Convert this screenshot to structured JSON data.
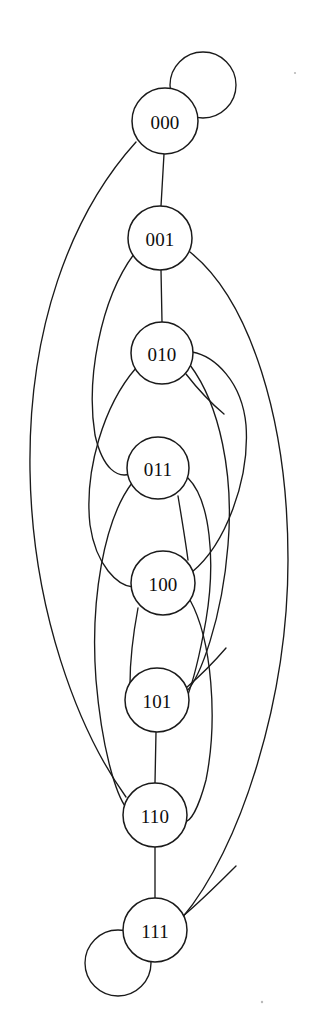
{
  "figure": {
    "background_color": "#ffffff",
    "stroke_color": "#1a1a1a",
    "label_color": "#0d0d0d",
    "width": 313,
    "height": 1035
  },
  "graph": {
    "kind": "de-bruijn-graph",
    "node_count": 8,
    "node_radius": 32,
    "nodes": [
      {
        "id": "n000",
        "label": "000",
        "cx": 165,
        "cy": 121,
        "r": 33
      },
      {
        "id": "n001",
        "label": "001",
        "cx": 160,
        "cy": 238,
        "r": 32
      },
      {
        "id": "n010",
        "label": "010",
        "cx": 162,
        "cy": 353,
        "r": 31
      },
      {
        "id": "n011",
        "label": "011",
        "cx": 158,
        "cy": 468,
        "r": 31
      },
      {
        "id": "n100",
        "label": "100",
        "cx": 163,
        "cy": 583,
        "r": 32
      },
      {
        "id": "n101",
        "label": "101",
        "cx": 157,
        "cy": 700,
        "r": 32
      },
      {
        "id": "n110",
        "label": "110",
        "cx": 155,
        "cy": 815,
        "r": 32
      },
      {
        "id": "n111",
        "label": "111",
        "cx": 155,
        "cy": 930,
        "r": 32
      }
    ],
    "self_loops": [
      {
        "id": "loop000",
        "node": "000",
        "cx": 203,
        "cy": 85,
        "r": 33
      },
      {
        "id": "loop111",
        "node": "111",
        "cx": 118,
        "cy": 963,
        "r": 33
      }
    ],
    "edges": [
      {
        "id": "e-000-001",
        "from": "000",
        "to": "001",
        "style": "straight"
      },
      {
        "id": "e-001-010",
        "from": "001",
        "to": "010",
        "style": "straight"
      },
      {
        "id": "e-101-110",
        "from": "101",
        "to": "110",
        "style": "straight"
      },
      {
        "id": "e-110-111",
        "from": "110",
        "to": "111",
        "style": "straight"
      },
      {
        "id": "e-000-110",
        "from": "000",
        "to": "110",
        "style": "curve-left-wide"
      },
      {
        "id": "e-001-011",
        "from": "001",
        "to": "011",
        "style": "curve-left"
      },
      {
        "id": "e-001-111",
        "from": "001",
        "to": "111",
        "style": "curve-right-wide"
      },
      {
        "id": "e-010-100",
        "from": "010",
        "to": "100",
        "style": "curve-left"
      },
      {
        "id": "e-010-101",
        "from": "010",
        "to": "101",
        "style": "curve-right"
      },
      {
        "id": "e-011-100",
        "from": "011",
        "to": "100",
        "style": "straight-diagonal"
      },
      {
        "id": "e-011-101",
        "from": "011",
        "to": "101",
        "style": "curve-right"
      },
      {
        "id": "e-100-010",
        "from": "100",
        "to": "010",
        "style": "curve-right-outer"
      },
      {
        "id": "e-100-101",
        "from": "100",
        "to": "101",
        "style": "straight-diagonal"
      },
      {
        "id": "e-011-110",
        "from": "011",
        "to": "110",
        "style": "curve-left"
      },
      {
        "id": "e-100-110",
        "from": "100",
        "to": "110",
        "style": "curve-left"
      }
    ]
  }
}
